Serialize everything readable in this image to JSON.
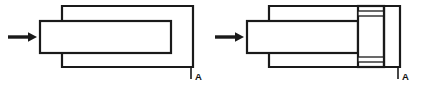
{
  "figure": {
    "background_color": "#ffffff",
    "line_color": "#1a1a1a",
    "face_color": "#ffffff",
    "width": 427,
    "height": 90
  },
  "panels": [
    {
      "id": "stage-1",
      "name": "before-compression",
      "arrow": {
        "name": "motion-arrow",
        "direction": "right",
        "x_start": 8,
        "x_end": 36,
        "y": 37
      },
      "housing": {
        "name": "outer-housing",
        "x": 62,
        "y": 6,
        "width": 131,
        "height": 61,
        "notch_x": 62,
        "notch_top_y": 21,
        "notch_bottom_y": 53
      },
      "block": {
        "name": "sliding-block",
        "x": 40,
        "y": 21,
        "width": 131,
        "height": 32
      },
      "label": {
        "name": "reference-label-a",
        "text": "A",
        "leader_x": 191,
        "leader_y_top": 67,
        "leader_y_bottom": 79,
        "text_x": 195,
        "text_y": 80
      }
    },
    {
      "id": "stage-2",
      "name": "after-compression",
      "arrow": {
        "name": "motion-arrow",
        "direction": "right",
        "x_start": 215,
        "x_end": 243,
        "y": 37
      },
      "housing": {
        "name": "outer-housing",
        "x": 269,
        "y": 6,
        "width": 131,
        "height": 61,
        "notch_x": 269,
        "notch_top_y": 21,
        "notch_bottom_y": 53
      },
      "block": {
        "name": "sliding-block",
        "x": 247,
        "y": 21,
        "width": 111,
        "height": 32
      },
      "compressed_element": {
        "name": "compressed-seal-pack",
        "x": 358,
        "y": 6,
        "width": 26,
        "height": 61,
        "bands": [
          {
            "name": "upper-band",
            "y": 11,
            "height": 5
          },
          {
            "name": "lower-band",
            "y": 57,
            "height": 5
          }
        ]
      },
      "chamber": {
        "name": "end-chamber",
        "x": 384,
        "y": 6,
        "width": 16,
        "height": 61
      },
      "label": {
        "name": "reference-label-a",
        "text": "A",
        "leader_x": 398,
        "leader_y_top": 67,
        "leader_y_bottom": 79,
        "text_x": 402,
        "text_y": 80
      }
    }
  ]
}
